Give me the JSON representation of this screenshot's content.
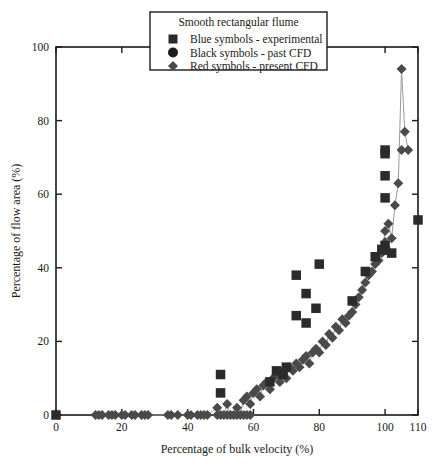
{
  "chart_data": {
    "type": "scatter",
    "title": "",
    "xlabel": "Percentage of bulk velocity (%)",
    "ylabel": "Percentage of flow area (%)",
    "xlim": [
      0,
      110
    ],
    "ylim": [
      0,
      100
    ],
    "xticks": [
      0,
      20,
      40,
      60,
      80,
      100,
      110
    ],
    "yticks": [
      0,
      20,
      40,
      60,
      80,
      100
    ],
    "xtick_labels": [
      "0",
      "20",
      "40",
      "60",
      "80",
      "100",
      "110"
    ],
    "ytick_labels": [
      "0",
      "20",
      "40",
      "60",
      "80",
      "100"
    ],
    "grid": false,
    "legend_position": "top-center",
    "legend_title": "Smooth rectangular flume",
    "series": [
      {
        "name": "Blue symbols - experimental",
        "marker": "square",
        "color": "#2b2b2b",
        "points": [
          [
            0,
            0
          ],
          [
            50,
            6
          ],
          [
            50,
            11
          ],
          [
            65,
            9
          ],
          [
            67,
            12
          ],
          [
            69,
            11
          ],
          [
            70,
            13
          ],
          [
            73,
            27
          ],
          [
            73,
            38
          ],
          [
            76,
            25
          ],
          [
            76,
            33
          ],
          [
            79,
            29
          ],
          [
            80,
            41
          ],
          [
            90,
            31
          ],
          [
            94,
            39
          ],
          [
            97,
            43
          ],
          [
            99,
            45
          ],
          [
            100,
            46
          ],
          [
            100,
            59
          ],
          [
            100,
            65
          ],
          [
            100,
            71
          ],
          [
            100,
            72
          ],
          [
            102,
            44
          ],
          [
            110,
            53
          ]
        ]
      },
      {
        "name": "Black symbols - past CFD",
        "marker": "circle",
        "color": "#1c1c1c",
        "points": [
          [
            100,
            45
          ]
        ]
      },
      {
        "name": "Red symbols - present CFD",
        "marker": "diamond",
        "color": "#4a4a4a",
        "points": [
          [
            12,
            0
          ],
          [
            13,
            0
          ],
          [
            14,
            0
          ],
          [
            16,
            0
          ],
          [
            17,
            0
          ],
          [
            18,
            0
          ],
          [
            20,
            0
          ],
          [
            21,
            0
          ],
          [
            23,
            0
          ],
          [
            24,
            0
          ],
          [
            26,
            0
          ],
          [
            27,
            0
          ],
          [
            28,
            0
          ],
          [
            34,
            0
          ],
          [
            35,
            0
          ],
          [
            37,
            0
          ],
          [
            40,
            0
          ],
          [
            41,
            0
          ],
          [
            43,
            0
          ],
          [
            44,
            0
          ],
          [
            45,
            0
          ],
          [
            46,
            0
          ],
          [
            49,
            0
          ],
          [
            50,
            0
          ],
          [
            51,
            0
          ],
          [
            52,
            0
          ],
          [
            53,
            0
          ],
          [
            54,
            0
          ],
          [
            55,
            0
          ],
          [
            56,
            0
          ],
          [
            57,
            0
          ],
          [
            58,
            0
          ],
          [
            59,
            0
          ],
          [
            49,
            2
          ],
          [
            52,
            3
          ],
          [
            55,
            2
          ],
          [
            57,
            4
          ],
          [
            58,
            5
          ],
          [
            59,
            3
          ],
          [
            60,
            6
          ],
          [
            61,
            7
          ],
          [
            62,
            5
          ],
          [
            63,
            8
          ],
          [
            64,
            9
          ],
          [
            65,
            7
          ],
          [
            66,
            10
          ],
          [
            67,
            11
          ],
          [
            68,
            9
          ],
          [
            69,
            12
          ],
          [
            70,
            10
          ],
          [
            71,
            13
          ],
          [
            72,
            12
          ],
          [
            73,
            14
          ],
          [
            74,
            13
          ],
          [
            75,
            15
          ],
          [
            76,
            16
          ],
          [
            77,
            14
          ],
          [
            78,
            17
          ],
          [
            79,
            18
          ],
          [
            80,
            17
          ],
          [
            81,
            20
          ],
          [
            82,
            19
          ],
          [
            83,
            22
          ],
          [
            84,
            21
          ],
          [
            85,
            24
          ],
          [
            86,
            23
          ],
          [
            87,
            26
          ],
          [
            88,
            25
          ],
          [
            89,
            27
          ],
          [
            90,
            28
          ],
          [
            91,
            30
          ],
          [
            92,
            32
          ],
          [
            93,
            34
          ],
          [
            94,
            36
          ],
          [
            95,
            38
          ],
          [
            96,
            39
          ],
          [
            97,
            41
          ],
          [
            98,
            42
          ],
          [
            99,
            44
          ],
          [
            100,
            47
          ],
          [
            100,
            50
          ],
          [
            101,
            52
          ],
          [
            102,
            48
          ],
          [
            103,
            57
          ],
          [
            104,
            63
          ],
          [
            105,
            72
          ],
          [
            106,
            77
          ],
          [
            107,
            72
          ],
          [
            105,
            94
          ]
        ]
      }
    ]
  },
  "legend": {
    "title": "Smooth rectangular flume",
    "entries": [
      {
        "marker": "square",
        "label": "Blue symbols - experimental"
      },
      {
        "marker": "circle",
        "label": "Black symbols - past CFD"
      },
      {
        "marker": "diamond",
        "label": "Red symbols - present CFD"
      }
    ]
  }
}
